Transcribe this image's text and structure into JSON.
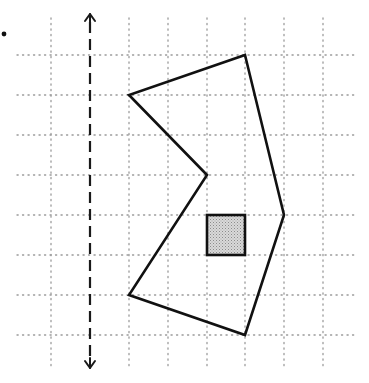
{
  "diagram": {
    "type": "reflection-grid",
    "grid": {
      "x_lines": [
        51,
        90,
        129,
        168,
        207,
        245,
        284,
        323
      ],
      "y_lines": [
        55,
        95,
        135,
        175,
        215,
        255,
        295,
        335
      ],
      "x_extent": [
        17,
        358
      ],
      "y_extent": [
        18,
        370
      ],
      "color": "#9a9a9a"
    },
    "mirror_line": {
      "x": 90,
      "y_top": 14,
      "y_bottom": 368,
      "style": "dashed",
      "arrows": "both"
    },
    "polygon": {
      "points": [
        [
          245,
          55
        ],
        [
          284,
          215
        ],
        [
          245,
          335
        ],
        [
          129,
          295
        ],
        [
          207,
          175
        ],
        [
          129,
          95
        ]
      ],
      "stroke": "#111111"
    },
    "shaded_square": {
      "x": 207,
      "y": 215,
      "w": 38,
      "h": 40,
      "fill": "#c8c8c8",
      "stroke": "#111111"
    },
    "bullet": {
      "x": 4,
      "y": 34
    }
  }
}
